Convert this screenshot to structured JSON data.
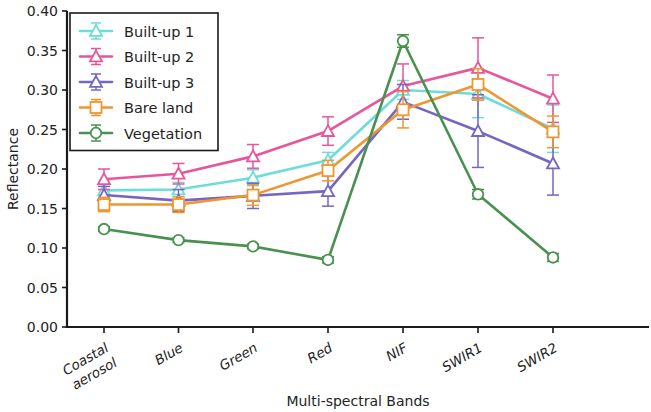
{
  "chart_data": {
    "type": "line",
    "title": "",
    "xlabel": "Multi-spectral Bands",
    "ylabel": "Reflectance",
    "categories": [
      "Coastal\naerosol",
      "Blue",
      "Green",
      "Red",
      "NIF",
      "SWIR1",
      "SWIR2"
    ],
    "category_labels": [
      "Coastal aerosol",
      "Blue",
      "Green",
      "Red",
      "NIF",
      "SWIR1",
      "SWIR2"
    ],
    "ylim": [
      0.0,
      0.4
    ],
    "yticks": [
      "0.00",
      "0.05",
      "0.10",
      "0.15",
      "0.20",
      "0.25",
      "0.30",
      "0.35",
      "0.40"
    ],
    "ytick_values": [
      0.0,
      0.05,
      0.1,
      0.15,
      0.2,
      0.25,
      0.3,
      0.35,
      0.4
    ],
    "grid": false,
    "legend_position": "upper left",
    "series": [
      {
        "name": "Built-up 1",
        "color": "#6fdcdc",
        "marker": "triangle",
        "values": [
          0.173,
          0.174,
          0.189,
          0.211,
          0.3,
          0.295,
          0.251
        ],
        "errors": [
          0.009,
          0.009,
          0.01,
          0.01,
          0.012,
          0.03,
          0.03
        ]
      },
      {
        "name": "Built-up 2",
        "color": "#e8559b",
        "marker": "triangle",
        "values": [
          0.187,
          0.194,
          0.216,
          0.248,
          0.305,
          0.328,
          0.289
        ],
        "errors": [
          0.013,
          0.013,
          0.015,
          0.018,
          0.028,
          0.038,
          0.03
        ]
      },
      {
        "name": "Built-up 3",
        "color": "#7566c4",
        "marker": "triangle",
        "values": [
          0.167,
          0.16,
          0.166,
          0.172,
          0.285,
          0.248,
          0.207
        ],
        "errors": [
          0.011,
          0.014,
          0.016,
          0.019,
          0.022,
          0.046,
          0.04
        ]
      },
      {
        "name": "Bare land",
        "color": "#f0962e",
        "marker": "square",
        "values": [
          0.155,
          0.155,
          0.167,
          0.198,
          0.275,
          0.307,
          0.247
        ],
        "errors": [
          0.009,
          0.01,
          0.013,
          0.013,
          0.023,
          0.02,
          0.02
        ]
      },
      {
        "name": "Vegetation",
        "color": "#4a9150",
        "marker": "circle",
        "values": [
          0.124,
          0.11,
          0.102,
          0.085,
          0.362,
          0.168,
          0.088
        ],
        "errors": [
          0.003,
          0.003,
          0.003,
          0.004,
          0.008,
          0.006,
          0.005
        ]
      }
    ]
  }
}
